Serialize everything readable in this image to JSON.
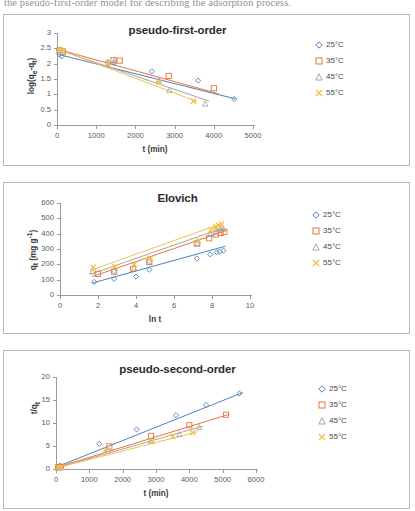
{
  "page": {
    "header_text_fragment": "the pseudo-first-order model for describing the adsorption process."
  },
  "legend_common": {
    "items": [
      {
        "label": "25°C",
        "marker": "diamond",
        "color": "#4f81bd"
      },
      {
        "label": "35°C",
        "marker": "square",
        "color": "#e8743b"
      },
      {
        "label": "45°C",
        "marker": "triangle",
        "color": "#a6a6a6"
      },
      {
        "label": "55°C",
        "marker": "cross",
        "color": "#f2c14e"
      }
    ]
  },
  "charts": [
    {
      "id": "pfo",
      "title": "pseudo-first-order",
      "xlabel": "t (min)",
      "ylabel": "log(qₑ-qₜ)"
    },
    {
      "id": "elo",
      "title": "Elovich",
      "xlabel": "ln t",
      "ylabel": "qₜ (mg g⁻¹)"
    },
    {
      "id": "pso",
      "title": "pseudo-second-order",
      "xlabel": "t (min)",
      "ylabel": "t/qₜ"
    }
  ],
  "chart_data": [
    {
      "type": "scatter",
      "id": "pseudo-first-order",
      "title": "pseudo-first-order",
      "xlabel": "t (min)",
      "ylabel": "log(qe-qt)",
      "xlim": [
        0,
        5000
      ],
      "ylim": [
        0,
        3
      ],
      "xticks": [
        0,
        1000,
        2000,
        3000,
        4000,
        5000
      ],
      "yticks": [
        0,
        0.5,
        1,
        1.5,
        2,
        2.5,
        3
      ],
      "grid": false,
      "legend_position": "right",
      "series": [
        {
          "name": "25°C",
          "color": "#4f81bd",
          "marker": "diamond",
          "x": [
            60,
            120,
            1300,
            1450,
            2420,
            3600,
            4520
          ],
          "y": [
            2.3,
            2.24,
            2.05,
            2.02,
            1.75,
            1.45,
            0.85
          ],
          "trend": {
            "x": [
              40,
              4560
            ],
            "y": [
              2.3,
              0.85
            ]
          }
        },
        {
          "name": "35°C",
          "color": "#e8743b",
          "marker": "square",
          "x": [
            60,
            150,
            1440,
            1600,
            2850,
            4000
          ],
          "y": [
            2.44,
            2.4,
            2.12,
            2.1,
            1.6,
            1.2
          ],
          "trend": {
            "x": [
              40,
              4120
            ],
            "y": [
              2.46,
              1.02
            ]
          }
        },
        {
          "name": "45°C",
          "color": "#a6a6a6",
          "marker": "triangle",
          "x": [
            60,
            160,
            1300,
            1450,
            2600,
            2870,
            3780
          ],
          "y": [
            2.44,
            2.38,
            2.03,
            2.08,
            1.45,
            1.15,
            0.7
          ],
          "trend": {
            "x": [
              40,
              3880
            ],
            "y": [
              2.45,
              0.78
            ]
          }
        },
        {
          "name": "55°C",
          "color": "#f2c14e",
          "marker": "cross",
          "x": [
            60,
            150,
            1300,
            2600,
            3480
          ],
          "y": [
            2.46,
            2.41,
            2.0,
            1.4,
            0.78
          ],
          "trend": {
            "x": [
              40,
              3580
            ],
            "y": [
              2.47,
              0.76
            ]
          }
        }
      ]
    },
    {
      "type": "scatter",
      "id": "elovich",
      "title": "Elovich",
      "xlabel": "ln t",
      "ylabel": "qt (mg g-1)",
      "xlim": [
        0,
        10
      ],
      "ylim": [
        0,
        600
      ],
      "xticks": [
        0,
        2,
        4,
        6,
        8,
        10
      ],
      "yticks": [
        0,
        100,
        200,
        300,
        400,
        500,
        600
      ],
      "grid": false,
      "legend_position": "right",
      "series": [
        {
          "name": "25°C",
          "color": "#4f81bd",
          "marker": "diamond",
          "x": [
            1.8,
            2.85,
            4.0,
            4.7,
            7.2,
            7.9,
            8.25,
            8.4,
            8.6
          ],
          "y": [
            85,
            105,
            120,
            165,
            238,
            265,
            278,
            283,
            290
          ],
          "trend": {
            "x": [
              1.7,
              8.7
            ],
            "y": [
              78,
              318
            ]
          }
        },
        {
          "name": "35°C",
          "color": "#e8743b",
          "marker": "square",
          "x": [
            2.0,
            2.85,
            3.85,
            4.7,
            7.2,
            7.85,
            8.2,
            8.45,
            8.65
          ],
          "y": [
            138,
            152,
            170,
            215,
            335,
            370,
            395,
            405,
            412
          ],
          "trend": {
            "x": [
              1.7,
              8.75
            ],
            "y": [
              120,
              420
            ]
          }
        },
        {
          "name": "45°C",
          "color": "#a6a6a6",
          "marker": "triangle",
          "x": [
            1.7,
            2.85,
            3.9,
            4.7,
            7.25,
            7.9,
            8.2,
            8.4,
            8.55
          ],
          "y": [
            155,
            160,
            178,
            225,
            340,
            400,
            420,
            432,
            440
          ],
          "trend": {
            "x": [
              1.6,
              8.65
            ],
            "y": [
              135,
              440
            ]
          }
        },
        {
          "name": "55°C",
          "color": "#f2c14e",
          "marker": "cross",
          "x": [
            1.75,
            2.9,
            3.9,
            4.75,
            7.3,
            7.95,
            8.2,
            8.35,
            8.5
          ],
          "y": [
            180,
            185,
            200,
            240,
            355,
            425,
            445,
            455,
            462
          ],
          "trend": {
            "x": [
              1.6,
              8.6
            ],
            "y": [
              160,
              470
            ]
          }
        }
      ]
    },
    {
      "type": "scatter",
      "id": "pseudo-second-order",
      "title": "pseudo-second-order",
      "xlabel": "t (min)",
      "ylabel": "t/qt",
      "xlim": [
        0,
        6000
      ],
      "ylim": [
        0,
        20
      ],
      "xticks": [
        0,
        1000,
        2000,
        3000,
        4000,
        5000,
        6000
      ],
      "yticks": [
        0,
        5,
        10,
        15,
        20
      ],
      "grid": false,
      "legend_position": "right",
      "series": [
        {
          "name": "25°C",
          "color": "#4f81bd",
          "marker": "diamond",
          "x": [
            60,
            120,
            1300,
            2420,
            3600,
            4500,
            5500
          ],
          "y": [
            0.5,
            0.7,
            5.5,
            8.6,
            11.7,
            13.9,
            16.4
          ],
          "trend": {
            "x": [
              0,
              5600
            ],
            "y": [
              0.4,
              16.6
            ]
          }
        },
        {
          "name": "35°C",
          "color": "#e8743b",
          "marker": "square",
          "x": [
            60,
            150,
            1600,
            2850,
            4000,
            5100
          ],
          "y": [
            0.4,
            0.5,
            4.9,
            7.2,
            9.5,
            11.8
          ],
          "trend": {
            "x": [
              0,
              5200
            ],
            "y": [
              0.3,
              11.9
            ]
          }
        },
        {
          "name": "45°C",
          "color": "#a6a6a6",
          "marker": "triangle",
          "x": [
            60,
            160,
            1550,
            2850,
            3700,
            4300
          ],
          "y": [
            0.3,
            0.4,
            4.4,
            6.2,
            7.6,
            9.1
          ],
          "trend": {
            "x": [
              0,
              4400
            ],
            "y": [
              0.2,
              9.3
            ]
          }
        },
        {
          "name": "55°C",
          "color": "#f2c14e",
          "marker": "cross",
          "x": [
            60,
            150,
            1500,
            2880,
            3500,
            4100
          ],
          "y": [
            0.3,
            0.4,
            4.3,
            6.0,
            7.1,
            7.9
          ],
          "trend": {
            "x": [
              0,
              4250
            ],
            "y": [
              0.2,
              8.1
            ]
          }
        }
      ]
    }
  ]
}
